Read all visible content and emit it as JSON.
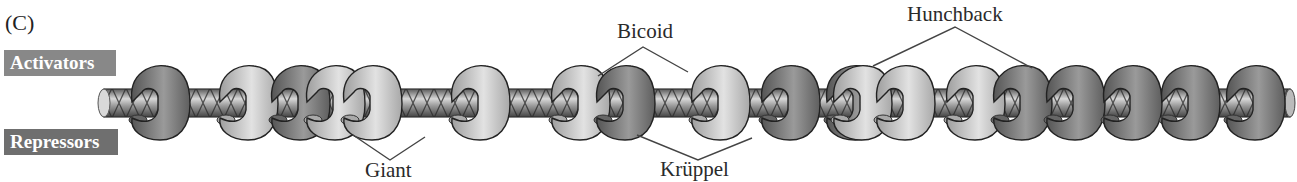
{
  "panel_label": "(C)",
  "legend": {
    "activators": "Activators",
    "repressors": "Repressors"
  },
  "callouts": {
    "bicoid": "Bicoid",
    "hunchback": "Hunchback",
    "giant": "Giant",
    "kruppel": "Krüppel"
  },
  "colors": {
    "activator_protein": "#bdbdbd",
    "activator_highlight": "#e2e2e2",
    "repressor_protein": "#6c6c6c",
    "repressor_highlight": "#9a9a9a",
    "dna_rod": "#8a8a8a",
    "outline": "#222222",
    "leader_line": "#444444"
  },
  "proteins": [
    {
      "type": "repressor",
      "x": 160
    },
    {
      "type": "activator",
      "x": 248
    },
    {
      "type": "repressor",
      "x": 300
    },
    {
      "type": "activator",
      "x": 335
    },
    {
      "type": "activator",
      "x": 372
    },
    {
      "type": "activator",
      "x": 480
    },
    {
      "type": "activator",
      "x": 580
    },
    {
      "type": "repressor",
      "x": 625
    },
    {
      "type": "activator",
      "x": 720
    },
    {
      "type": "repressor",
      "x": 790
    },
    {
      "type": "repressor",
      "x": 855
    },
    {
      "type": "activator",
      "x": 862
    },
    {
      "type": "activator",
      "x": 905
    },
    {
      "type": "activator",
      "x": 975
    },
    {
      "type": "repressor",
      "x": 1022
    },
    {
      "type": "repressor",
      "x": 1075
    },
    {
      "type": "repressor",
      "x": 1132
    },
    {
      "type": "repressor",
      "x": 1190
    },
    {
      "type": "repressor",
      "x": 1255
    }
  ]
}
